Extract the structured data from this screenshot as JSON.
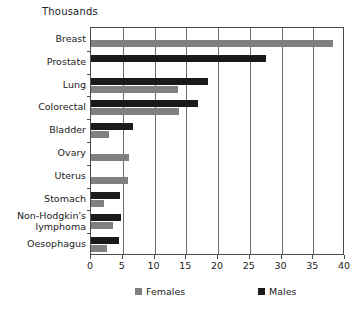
{
  "chart_data": {
    "type": "bar",
    "orientation": "horizontal",
    "title": "Thousands",
    "xlabel": "",
    "ylabel": "",
    "xlim": [
      0,
      40
    ],
    "xticks": [
      0,
      5,
      10,
      15,
      20,
      25,
      30,
      35,
      40
    ],
    "xtick_labels": [
      "0",
      "5",
      "10",
      "15",
      "20",
      "25",
      "30",
      "35",
      "40"
    ],
    "grid": "vertical",
    "legend_position": "bottom",
    "categories": [
      "Breast",
      "Prostate",
      "Lung",
      "Colorectal",
      "Bladder",
      "Ovary",
      "Uterus",
      "Stomach",
      "Non-Hodgkin's\nlymphoma",
      "Oesophagus"
    ],
    "series": [
      {
        "name": "Females",
        "color": "#808080",
        "values": [
          38.1,
          0,
          13.7,
          13.9,
          2.8,
          6.0,
          5.8,
          2.0,
          3.5,
          2.5
        ]
      },
      {
        "name": "Males",
        "color": "#1a1a1a",
        "values": [
          0,
          27.5,
          18.4,
          16.8,
          6.6,
          0,
          0,
          4.6,
          4.7,
          4.4
        ]
      }
    ]
  },
  "legend": {
    "items": [
      {
        "label": "Females",
        "color": "#808080"
      },
      {
        "label": "Males",
        "color": "#1a1a1a"
      }
    ]
  },
  "colors": {
    "females": "#808080",
    "males": "#1a1a1a",
    "axis": "#4a4a4a",
    "grid": "#6b6b6b",
    "text": "#222222",
    "background": "#ffffff"
  }
}
